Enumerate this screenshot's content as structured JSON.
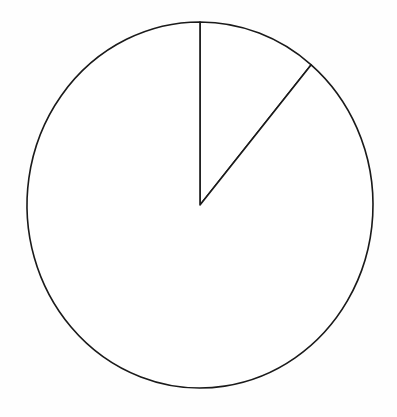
{
  "figure": {
    "background_color": "#fefefe",
    "stroke_color": "#1a1a1a",
    "slice_fill_color": "#ffffff",
    "title": "",
    "width": 397,
    "height": 417
  },
  "chart_data": {
    "type": "pie",
    "title": "",
    "subtitle": "",
    "xlabel": "",
    "ylabel": "",
    "grid": false,
    "legend": false,
    "legend_position": "none",
    "labels": [
      "Slice 1",
      "Slice 2"
    ],
    "values": [
      11.1,
      88.9
    ],
    "angles_deg": [
      40,
      320
    ],
    "start_angle_deg": 0,
    "direction": "clockwise",
    "colors": [
      "#ffffff",
      "#ffffff"
    ],
    "edge_color": "#1a1a1a",
    "edge_width": 1.6,
    "show_value_labels": false,
    "annotations": [],
    "geometry": {
      "center_x": 200,
      "center_y": 205,
      "radius_x": 173,
      "radius_y": 183,
      "boundary_points": [
        {
          "name": "top-vertex",
          "x": 202,
          "y": 25,
          "angle_deg": 0
        },
        {
          "name": "upper-right-vertex",
          "x": 312,
          "y": 71,
          "angle_deg": 40
        }
      ]
    }
  }
}
